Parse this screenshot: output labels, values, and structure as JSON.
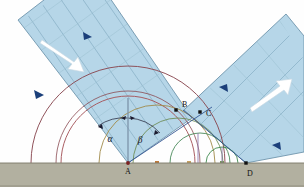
{
  "figure": {
    "background_color": "#ffffff"
  },
  "ground": {
    "name": "reflecting-surface",
    "fill": "#b2b0a0",
    "edge_color": "#7a7868",
    "top_y": 163,
    "height": 24
  },
  "beams": {
    "incident": {
      "label": "incident-wavefront-beam",
      "fill": "#b6d6e8",
      "edge": "#6f95ad",
      "wavefront_line_color": "#8fb6c9",
      "arrow_color": "#ffffff",
      "direction_marker_color": "#1b3f7a"
    },
    "reflected": {
      "label": "reflected-wavefront-beam",
      "fill": "#b6d6e8",
      "edge": "#6f95ad",
      "wavefront_line_color": "#8fb6c9",
      "arrow_color": "#ffffff",
      "direction_marker_color": "#1b3f7a"
    }
  },
  "points": [
    {
      "id": "A",
      "label": "A",
      "x": 128,
      "y": 163,
      "label_x": 128,
      "label_y": 174,
      "marker": "dot",
      "color": "#7a2020"
    },
    {
      "id": "B",
      "label": "B",
      "x": 176,
      "y": 110,
      "label_x": 182,
      "label_y": 106,
      "marker": "square",
      "color": "#101010"
    },
    {
      "id": "C",
      "label": "C",
      "x": 200,
      "y": 112,
      "label_x": 207,
      "label_y": 114,
      "marker": "square",
      "color": "#101010"
    },
    {
      "id": "D",
      "label": "D",
      "x": 246,
      "y": 163,
      "label_x": 248,
      "label_y": 176,
      "marker": "square",
      "color": "#101010"
    }
  ],
  "angles": [
    {
      "id": "alpha",
      "label": "α",
      "x": 112,
      "y": 139,
      "color": "#1a1a2e",
      "meaning": "angle-of-incidence"
    },
    {
      "id": "beta",
      "label": "β",
      "x": 140,
      "y": 140,
      "color": "#1a1a2e",
      "meaning": "angle-of-reflection"
    }
  ],
  "normal_line": {
    "name": "normal-at-A",
    "color": "#7d94aa",
    "x": 128,
    "y_top": 98,
    "y_bottom": 163
  },
  "wavelets": {
    "description": "Huygens secondary wavelets emitted from successive points along the surface between A and D",
    "arcs": [
      {
        "cx": 128,
        "cy": 163,
        "r": 97,
        "color": "#8a4a52"
      },
      {
        "cx": 128,
        "cy": 163,
        "r": 67,
        "color": "#a5565c"
      },
      {
        "cx": 128,
        "cy": 163,
        "r": 72,
        "color": "#8a4a52"
      },
      {
        "cx": 157,
        "cy": 163,
        "r": 58,
        "color": "#a08a4a"
      },
      {
        "cx": 178,
        "cy": 163,
        "r": 45,
        "color": "#6f8f5a"
      },
      {
        "cx": 200,
        "cy": 163,
        "r": 30,
        "color": "#4a8a5a"
      },
      {
        "cx": 222,
        "cy": 163,
        "r": 16,
        "color": "#3f8a4f"
      }
    ],
    "center_markers": [
      {
        "x": 157,
        "y": 163,
        "color": "#c07a3a"
      },
      {
        "x": 189,
        "y": 163,
        "color": "#c8a060"
      },
      {
        "x": 222,
        "y": 163,
        "color": "#7a9a5a"
      }
    ]
  },
  "rays": {
    "incident_ray_color": "#2b4f8f",
    "reflected_ray_color": "#2b4f8f",
    "tangent_line_color": "#2b4f8f"
  }
}
